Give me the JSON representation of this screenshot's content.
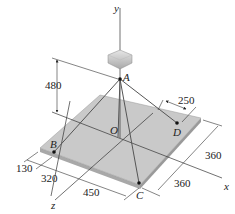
{
  "figure": {
    "type": "3D statics diagram",
    "axes": {
      "x": "x",
      "y": "y",
      "z": "z"
    },
    "points": {
      "A": "A",
      "B": "B",
      "C": "C",
      "D": "D",
      "O": "O"
    },
    "dimensions": {
      "height_A": "480",
      "d_250": "250",
      "d_130": "130",
      "d_320": "320",
      "d_450": "450",
      "d_360_upper": "360",
      "d_360_lower": "360"
    },
    "colors": {
      "plate_top": "#c9c9c9",
      "plate_edge": "#a8a8a8",
      "block": "#d4d4d4",
      "lines": "#333333"
    }
  }
}
